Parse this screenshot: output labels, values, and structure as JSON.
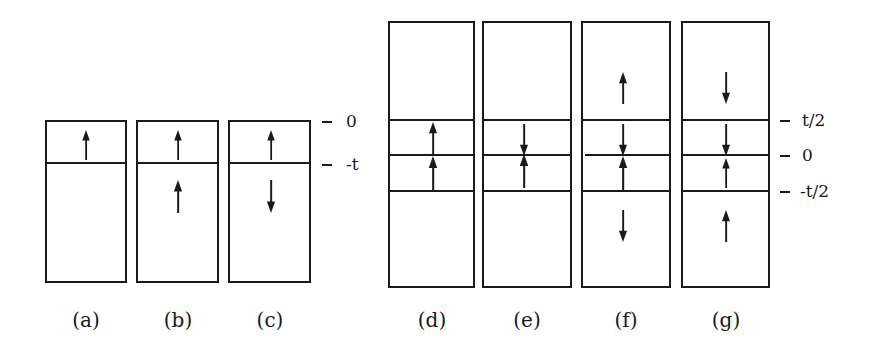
{
  "figure": {
    "left_group": {
      "panels": [
        {
          "id": "a",
          "label": "(a)",
          "layers": [
            "up",
            ""
          ]
        },
        {
          "id": "b",
          "label": "(b)",
          "layers": [
            "up",
            "up"
          ]
        },
        {
          "id": "c",
          "label": "(c)",
          "layers": [
            "up",
            "down"
          ]
        }
      ],
      "ticks": [
        {
          "label": "0"
        },
        {
          "label": "-t"
        }
      ]
    },
    "right_group": {
      "panels": [
        {
          "id": "d",
          "label": "(d)",
          "layers": [
            "",
            "up",
            "up",
            ""
          ]
        },
        {
          "id": "e",
          "label": "(e)",
          "layers": [
            "",
            "down",
            "up",
            ""
          ]
        },
        {
          "id": "f",
          "label": "(f)",
          "layers": [
            "up",
            "down",
            "up",
            "down"
          ]
        },
        {
          "id": "g",
          "label": "(g)",
          "layers": [
            "down",
            "down",
            "up",
            "up"
          ]
        }
      ],
      "ticks": [
        {
          "label": "t/2"
        },
        {
          "label": "0"
        },
        {
          "label": "-t/2"
        }
      ]
    }
  }
}
